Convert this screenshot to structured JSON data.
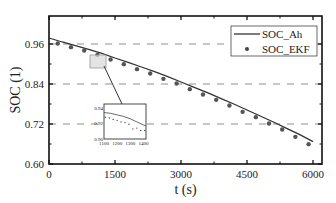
{
  "chart_data": {
    "type": "line",
    "title": "",
    "xlabel": "t (s)",
    "ylabel": "SOC (1)",
    "xlim": [
      0,
      6200
    ],
    "ylim": [
      0.6,
      1.0
    ],
    "xticks": [
      0,
      1500,
      3000,
      4500,
      6000
    ],
    "xtick_labels": [
      "0",
      "1500",
      "3000",
      "4500",
      "6000"
    ],
    "yticks": [
      0.6,
      0.72,
      0.84,
      0.96
    ],
    "ytick_labels": [
      "0.60",
      "0.72",
      "0.84",
      "0.96"
    ],
    "grid": "horizontal dashed at y ticks",
    "legend_position": "upper right",
    "legend": [
      "SOC_Ah",
      "SOC_EKF"
    ],
    "series": [
      {
        "name": "SOC_Ah",
        "style": "solid line",
        "x": [
          0,
          300,
          600,
          900,
          1200,
          1500,
          1800,
          2100,
          2400,
          2700,
          3000,
          3300,
          3600,
          3900,
          4200,
          4500,
          4800,
          5100,
          5400,
          5700,
          6000
        ],
        "values": [
          0.978,
          0.966,
          0.955,
          0.944,
          0.932,
          0.918,
          0.905,
          0.891,
          0.877,
          0.862,
          0.846,
          0.83,
          0.814,
          0.797,
          0.78,
          0.762,
          0.744,
          0.726,
          0.707,
          0.688,
          0.667
        ]
      },
      {
        "name": "SOC_EKF",
        "style": "dots",
        "x": [
          200,
          500,
          800,
          1100,
          1400,
          1700,
          2000,
          2300,
          2600,
          2900,
          3200,
          3500,
          3800,
          4100,
          4400,
          4700,
          5000,
          5300,
          5600,
          5900
        ],
        "values": [
          0.966,
          0.955,
          0.945,
          0.932,
          0.918,
          0.904,
          0.889,
          0.876,
          0.86,
          0.846,
          0.829,
          0.813,
          0.797,
          0.78,
          0.761,
          0.745,
          0.726,
          0.708,
          0.686,
          0.664
        ]
      }
    ],
    "inset": {
      "xlim": [
        1100,
        1420
      ],
      "ylim": [
        0.9,
        0.945
      ],
      "xtick_labels": [
        "1100",
        "1200",
        "1300",
        "1400"
      ],
      "ytick_labels": [
        "0.90",
        "0.92",
        "0.94"
      ],
      "series": [
        {
          "name": "SOC_Ah",
          "x": [
            1100,
            1150,
            1200,
            1250,
            1300,
            1350,
            1400,
            1420
          ],
          "values": [
            0.934,
            0.933,
            0.931,
            0.929,
            0.926,
            0.922,
            0.918,
            0.917
          ]
        },
        {
          "name": "SOC_EKF",
          "x": [
            1110,
            1140,
            1170,
            1200,
            1230,
            1260,
            1290,
            1320,
            1350,
            1380,
            1410
          ],
          "values": [
            0.928,
            0.927,
            0.925,
            0.924,
            0.922,
            0.921,
            0.919,
            0.913,
            0.914,
            0.911,
            0.911
          ]
        }
      ]
    }
  }
}
